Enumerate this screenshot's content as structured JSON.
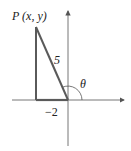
{
  "diagram": {
    "point_label": "P (x, y)",
    "hypotenuse_label": "5",
    "base_label": "−2",
    "angle_label": "θ",
    "colors": {
      "axes": "#555555",
      "triangle": "#5a5a5a",
      "text": "#222222"
    }
  }
}
